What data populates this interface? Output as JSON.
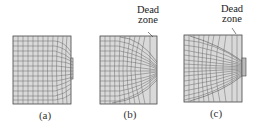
{
  "figure": {
    "panels": [
      {
        "id": "a",
        "label": "(a)",
        "annotation": null
      },
      {
        "id": "b",
        "label": "(b)",
        "annotation": {
          "line1": "Dead",
          "line2": "zone"
        }
      },
      {
        "id": "c",
        "label": "(c)",
        "annotation": {
          "line1": "Dead",
          "line2": "zone"
        }
      }
    ],
    "colors": {
      "fill": "#d9d9d9",
      "grid": "#6b6b6b",
      "border": "#444444",
      "text": "#222222"
    }
  }
}
